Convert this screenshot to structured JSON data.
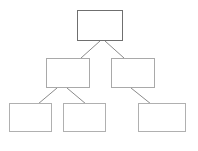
{
  "diagram": {
    "type": "hierarchy-tree",
    "title": "",
    "background_color": "#ffffff",
    "canvas": {
      "width": 198,
      "height": 151
    },
    "root_border_color": "#6f6f6f",
    "branch_border_color": "#a9a9a9",
    "leaf_border_color": "#b0b0b0",
    "connector_color": "#8a8a8a",
    "nodes": [
      {
        "id": "root",
        "level": 0,
        "label": "",
        "x": 77,
        "y": 10,
        "width": 46,
        "height": 31
      },
      {
        "id": "branch-left",
        "level": 1,
        "label": "",
        "x": 46,
        "y": 58,
        "width": 44,
        "height": 30
      },
      {
        "id": "branch-right",
        "level": 1,
        "label": "",
        "x": 111,
        "y": 58,
        "width": 44,
        "height": 30
      },
      {
        "id": "leaf-one",
        "level": 2,
        "label": "",
        "x": 9,
        "y": 103,
        "width": 43,
        "height": 29
      },
      {
        "id": "leaf-two",
        "level": 2,
        "label": "",
        "x": 63,
        "y": 103,
        "width": 43,
        "height": 29
      },
      {
        "id": "leaf-three",
        "level": 2,
        "label": "",
        "x": 138,
        "y": 103,
        "width": 48,
        "height": 29
      }
    ],
    "connectors": [
      {
        "id": "root-to-branch-left",
        "from": "root",
        "to": "branch-left",
        "x1": 100,
        "y1": 41,
        "x2": 81,
        "y2": 58
      },
      {
        "id": "root-to-branch-right",
        "from": "root",
        "to": "branch-right",
        "x1": 105,
        "y1": 41,
        "x2": 124,
        "y2": 58
      },
      {
        "id": "branch-left-to-leaf-one",
        "from": "branch-left",
        "to": "leaf-one",
        "x1": 57,
        "y1": 88,
        "x2": 38,
        "y2": 104
      },
      {
        "id": "branch-left-to-leaf-two",
        "from": "branch-left",
        "to": "leaf-two",
        "x1": 67,
        "y1": 88,
        "x2": 86,
        "y2": 104
      },
      {
        "id": "branch-right-to-leaf-three",
        "from": "branch-right",
        "to": "leaf-three",
        "x1": 131,
        "y1": 88,
        "x2": 151,
        "y2": 104
      }
    ]
  }
}
